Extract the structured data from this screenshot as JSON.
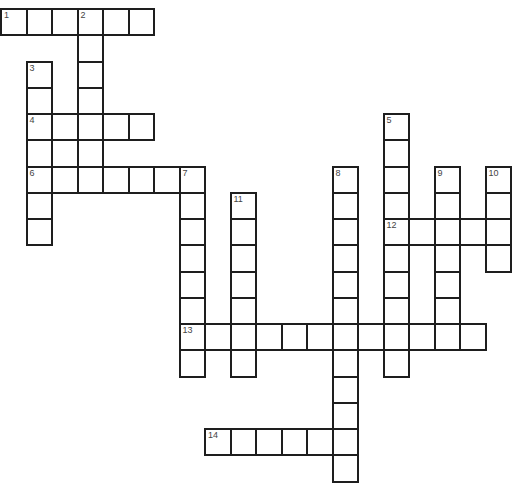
{
  "puzzle": {
    "grid": {
      "origin_x": 0,
      "origin_y": 8,
      "cell_width": 25.5,
      "cell_height": 26.25,
      "border_color": "#1e1e1e",
      "cell_fill": "#ffffff",
      "number_color": "#444444"
    },
    "entries": [
      {
        "number": "1",
        "direction": "across",
        "row": 0,
        "col": 0,
        "length": 6
      },
      {
        "number": "2",
        "direction": "down",
        "row": 0,
        "col": 3,
        "length": 6
      },
      {
        "number": "3",
        "direction": "down",
        "row": 2,
        "col": 1,
        "length": 7
      },
      {
        "number": "4",
        "direction": "across",
        "row": 4,
        "col": 1,
        "length": 5
      },
      {
        "number": "5",
        "direction": "down",
        "row": 4,
        "col": 15,
        "length": 10
      },
      {
        "number": "6",
        "direction": "across",
        "row": 6,
        "col": 1,
        "length": 7
      },
      {
        "number": "7",
        "direction": "down",
        "row": 6,
        "col": 7,
        "length": 8
      },
      {
        "number": "8",
        "direction": "down",
        "row": 6,
        "col": 13,
        "length": 12
      },
      {
        "number": "9",
        "direction": "down",
        "row": 6,
        "col": 17,
        "length": 7
      },
      {
        "number": "10",
        "direction": "down",
        "row": 6,
        "col": 19,
        "length": 4
      },
      {
        "number": "11",
        "direction": "down",
        "row": 7,
        "col": 9,
        "length": 7
      },
      {
        "number": "12",
        "direction": "across",
        "row": 8,
        "col": 15,
        "length": 5
      },
      {
        "number": "13",
        "direction": "across",
        "row": 12,
        "col": 7,
        "length": 12
      },
      {
        "number": "14",
        "direction": "across",
        "row": 16,
        "col": 8,
        "length": 6
      }
    ],
    "extra_cells": [
      {
        "row": 5,
        "col": 2
      }
    ]
  }
}
